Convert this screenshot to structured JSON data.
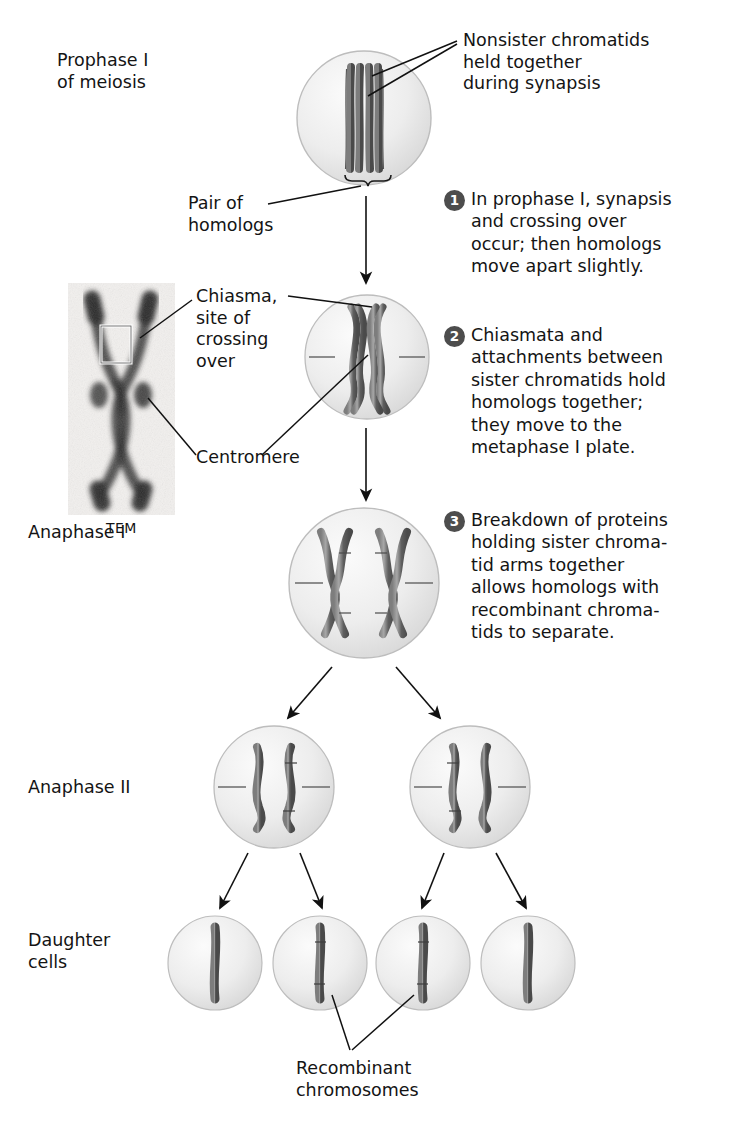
{
  "figure": {
    "type": "biology-diagram",
    "topic": "Crossing over and recombinant chromosomes in meiosis"
  },
  "stage_labels": {
    "prophase": "Prophase I\nof meiosis",
    "anaphase_i": "Anaphase I",
    "anaphase_ii": "Anaphase II",
    "daughter": "Daughter\ncells"
  },
  "callouts": {
    "nonsister": "Nonsister chromatids\nheld together\nduring synapsis",
    "pair_of_homologs": "Pair of\nhomologs",
    "chiasma": "Chiasma,\nsite of\ncrossing\nover",
    "centromere": "Centromere",
    "recombinant": "Recombinant\nchromosomes",
    "tem_caption": "TEM"
  },
  "steps": [
    {
      "number": "1",
      "text": "In prophase I, synapsis\nand crossing over\noccur; then homologs\nmove apart slightly."
    },
    {
      "number": "2",
      "text": "Chiasmata and\nattachments between\nsister chromatids hold\nhomologs together;\nthey move to the\nmetaphase I plate."
    },
    {
      "number": "3",
      "text": "Breakdown of proteins\nholding sister chroma-\ntid arms together\nallows homologs with\nrecombinant chroma-\ntids to separate."
    }
  ],
  "colors": {
    "chromosome_dark": "#4a4a4a",
    "chromosome_mid": "#6e6e6e",
    "chromosome_light": "#9a9a9a",
    "cell_fill": "#ededed",
    "cell_edge": "#b8b8b8",
    "badge_fill": "#4d4d4d",
    "line": "#111111",
    "text": "#141414"
  },
  "cells": [
    {
      "name": "prophase-i-cell",
      "cx": 364,
      "cy": 118,
      "r": 69,
      "contents": "two homologs paired as four parallel chromatids"
    },
    {
      "name": "metaphase-i-cell",
      "cx": 367,
      "cy": 357,
      "r": 64,
      "contents": "homologs crossed at chiasma, spindle lines"
    },
    {
      "name": "anaphase-i-cell",
      "cx": 364,
      "cy": 583,
      "r": 77,
      "contents": "two X-shaped homologs with recombinant tips"
    },
    {
      "name": "anaphase-ii-cell-left",
      "cx": 274,
      "cy": 787,
      "r": 62,
      "contents": "one plain and one recombinant chromatid"
    },
    {
      "name": "anaphase-ii-cell-right",
      "cx": 470,
      "cy": 787,
      "r": 62,
      "contents": "one recombinant and one plain chromatid"
    },
    {
      "name": "daughter-cell-1",
      "cx": 215,
      "cy": 963,
      "r": 48,
      "contents": "non-recombinant chromosome"
    },
    {
      "name": "daughter-cell-2",
      "cx": 320,
      "cy": 963,
      "r": 48,
      "contents": "recombinant chromosome"
    },
    {
      "name": "daughter-cell-3",
      "cx": 423,
      "cy": 963,
      "r": 48,
      "contents": "recombinant chromosome"
    },
    {
      "name": "daughter-cell-4",
      "cx": 528,
      "cy": 963,
      "r": 48,
      "contents": "non-recombinant chromosome"
    }
  ]
}
